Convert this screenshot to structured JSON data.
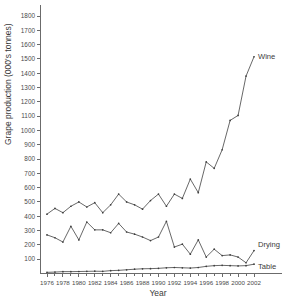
{
  "chart_data": {
    "type": "line",
    "title": "",
    "xlabel": "Year",
    "ylabel": "Grape production (000's tonnes)",
    "xlim": [
      1975,
      2003
    ],
    "ylim": [
      0,
      1850
    ],
    "grid": false,
    "legend_position": "inline-right",
    "x_tick_labels": [
      "1976",
      "1978",
      "1980",
      "1982",
      "1984",
      "1986",
      "1988",
      "1990",
      "1992",
      "1994",
      "1996",
      "1998",
      "2000",
      "2002"
    ],
    "x_ticks": [
      1976,
      1978,
      1980,
      1982,
      1984,
      1986,
      1988,
      1990,
      1992,
      1994,
      1996,
      1998,
      2000,
      2002
    ],
    "y_tick_labels": [
      "100",
      "200",
      "300",
      "400",
      "500",
      "600",
      "700",
      "800",
      "900",
      "1000",
      "1100",
      "1200",
      "1300",
      "1400",
      "1500",
      "1600",
      "1700",
      "1800"
    ],
    "y_ticks": [
      100,
      200,
      300,
      400,
      500,
      600,
      700,
      800,
      900,
      1000,
      1100,
      1200,
      1300,
      1400,
      1500,
      1600,
      1700,
      1800
    ],
    "x": [
      1976,
      1977,
      1978,
      1979,
      1980,
      1981,
      1982,
      1983,
      1984,
      1985,
      1986,
      1987,
      1988,
      1989,
      1990,
      1991,
      1992,
      1993,
      1994,
      1995,
      1996,
      1997,
      1998,
      1999,
      2000,
      2001,
      2002
    ],
    "series": [
      {
        "name": "Wine",
        "label": "Wine",
        "color": "#4d4d4d",
        "values": [
          415,
          455,
          425,
          470,
          500,
          465,
          495,
          425,
          480,
          555,
          500,
          480,
          450,
          510,
          555,
          470,
          555,
          525,
          660,
          565,
          780,
          735,
          865,
          1070,
          1105,
          1380,
          1515
        ]
      },
      {
        "name": "Drying",
        "label": "Drying",
        "color": "#4d4d4d",
        "values": [
          270,
          250,
          220,
          330,
          235,
          360,
          305,
          305,
          285,
          350,
          290,
          275,
          255,
          230,
          255,
          365,
          185,
          205,
          135,
          235,
          115,
          170,
          125,
          130,
          115,
          75,
          160
        ]
      },
      {
        "name": "Table",
        "label": "Table",
        "color": "#4d4d4d",
        "values": [
          8,
          10,
          13,
          13,
          14,
          15,
          16,
          15,
          20,
          22,
          26,
          30,
          33,
          34,
          36,
          40,
          42,
          40,
          38,
          42,
          50,
          55,
          57,
          55,
          53,
          55,
          65
        ]
      }
    ]
  }
}
